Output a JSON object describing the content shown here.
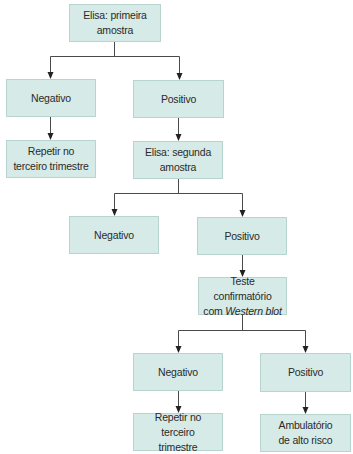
{
  "diagram": {
    "type": "flowchart",
    "colors": {
      "box_fill": "#d6ebe7",
      "box_border": "#b8d4cf",
      "line": "#4a4a4a",
      "text": "#2a2a2a"
    },
    "nodes": {
      "elisa1": {
        "line1": "Elisa: primeira",
        "line2": "amostra"
      },
      "neg1": {
        "label": "Negativo"
      },
      "pos1": {
        "label": "Positivo"
      },
      "repetir1": {
        "line1": "Repetir no",
        "line2": "terceiro trimestre"
      },
      "elisa2": {
        "line1": "Elisa: segunda",
        "line2": "amostra"
      },
      "neg2": {
        "label": "Negativo"
      },
      "pos2": {
        "label": "Positivo"
      },
      "teste": {
        "line1": "Teste confirmatório",
        "line2_prefix": "com ",
        "line2_italic": "Western blot"
      },
      "neg3": {
        "label": "Negativo"
      },
      "pos3": {
        "label": "Positivo"
      },
      "repetir3": {
        "line1": "Repetir no terceiro",
        "line2": "trimestre"
      },
      "ambulatorio": {
        "line1": "Ambulatório",
        "line2": "de alto risco"
      }
    },
    "edges": [
      {
        "from": "elisa1",
        "to": "neg1"
      },
      {
        "from": "elisa1",
        "to": "pos1"
      },
      {
        "from": "neg1",
        "to": "repetir1"
      },
      {
        "from": "pos1",
        "to": "elisa2"
      },
      {
        "from": "elisa2",
        "to": "neg2"
      },
      {
        "from": "elisa2",
        "to": "pos2"
      },
      {
        "from": "pos2",
        "to": "teste"
      },
      {
        "from": "teste",
        "to": "neg3"
      },
      {
        "from": "teste",
        "to": "pos3"
      },
      {
        "from": "neg3",
        "to": "repetir3"
      },
      {
        "from": "pos3",
        "to": "ambulatorio"
      }
    ]
  }
}
